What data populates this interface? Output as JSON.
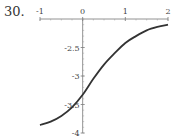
{
  "problem_number": "30.",
  "chart_data": {
    "type": "line",
    "title": "",
    "xlabel": "",
    "ylabel": "",
    "xlim": [
      -1,
      2
    ],
    "ylim": [
      -4,
      -2
    ],
    "grid": false,
    "x_axis_at_y": -2,
    "y_axis_at_x": 0,
    "x_ticks": [
      "-1",
      "0",
      "1",
      "2"
    ],
    "y_ticks": [
      "-2.5",
      "-3",
      "-3.5",
      "-4"
    ],
    "series": [
      {
        "name": "curve",
        "x": [
          -1,
          -0.75,
          -0.5,
          -0.25,
          0,
          0.25,
          0.5,
          0.75,
          1,
          1.25,
          1.5,
          1.75,
          2
        ],
        "y": [
          -3.86,
          -3.8,
          -3.7,
          -3.55,
          -3.33,
          -3.05,
          -2.8,
          -2.6,
          -2.42,
          -2.3,
          -2.2,
          -2.14,
          -2.1
        ]
      }
    ],
    "color": "#333333"
  }
}
